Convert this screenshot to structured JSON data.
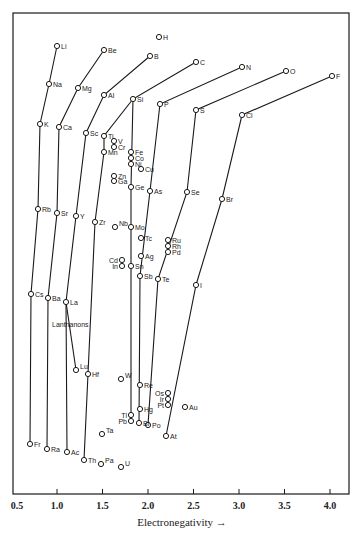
{
  "chart_data": {
    "type": "scatter",
    "title": "",
    "xlabel": "Electronegativity →",
    "ylabel": "",
    "xlim": [
      0.5,
      4.1
    ],
    "x_ticks": [
      "0.5",
      "1.0",
      "1.5",
      "2.0",
      "2.5",
      "3.0",
      "3.5",
      "4.0"
    ],
    "grid": false,
    "legend": null,
    "annotations": [
      "Lanthanons"
    ],
    "colors": {
      "ink": "#1a1a1a",
      "background": "#ffffff"
    },
    "points": [
      {
        "el": "H",
        "x": 2.1,
        "px": 159,
        "py": 37
      },
      {
        "el": "Li",
        "x": 1.0,
        "px": 57,
        "py": 46
      },
      {
        "el": "Na",
        "x": 0.9,
        "px": 49,
        "py": 84
      },
      {
        "el": "K",
        "x": 0.8,
        "px": 40,
        "py": 124
      },
      {
        "el": "Rb",
        "x": 0.8,
        "px": 38,
        "py": 209
      },
      {
        "el": "Cs",
        "x": 0.7,
        "px": 31,
        "py": 294
      },
      {
        "el": "Fr",
        "x": 0.7,
        "px": 30,
        "py": 444
      },
      {
        "el": "Be",
        "x": 1.5,
        "px": 104,
        "py": 50
      },
      {
        "el": "Mg",
        "x": 1.2,
        "px": 78,
        "py": 88
      },
      {
        "el": "Ca",
        "x": 1.0,
        "px": 59,
        "py": 127
      },
      {
        "el": "Sr",
        "x": 1.0,
        "px": 57,
        "py": 213
      },
      {
        "el": "Ba",
        "x": 0.9,
        "px": 48,
        "py": 298
      },
      {
        "el": "Ra",
        "x": 0.9,
        "px": 47,
        "py": 449
      },
      {
        "el": "B",
        "x": 2.0,
        "px": 150,
        "py": 56
      },
      {
        "el": "Al",
        "x": 1.5,
        "px": 104,
        "py": 95
      },
      {
        "el": "Sc",
        "x": 1.3,
        "px": 86,
        "py": 133
      },
      {
        "el": "Y",
        "x": 1.2,
        "px": 76,
        "py": 216
      },
      {
        "el": "La",
        "x": 1.1,
        "px": 66,
        "py": 302
      },
      {
        "el": "Lu",
        "x": 1.2,
        "px": 76,
        "py": 370
      },
      {
        "el": "Ac",
        "x": 1.1,
        "px": 67,
        "py": 452
      },
      {
        "el": "C",
        "x": 2.5,
        "px": 196,
        "py": 62
      },
      {
        "el": "Si",
        "x": 1.8,
        "px": 133,
        "py": 99
      },
      {
        "el": "Ti",
        "x": 1.5,
        "px": 104,
        "py": 136
      },
      {
        "el": "Mn",
        "x": 1.5,
        "px": 104,
        "py": 152
      },
      {
        "el": "Zr",
        "x": 1.4,
        "px": 95,
        "py": 222
      },
      {
        "el": "Hf",
        "x": 1.3,
        "px": 88,
        "py": 374
      },
      {
        "el": "Th",
        "x": 1.3,
        "px": 84,
        "py": 460
      },
      {
        "el": "N",
        "x": 3.0,
        "px": 242,
        "py": 67
      },
      {
        "el": "P",
        "x": 2.1,
        "px": 160,
        "py": 104
      },
      {
        "el": "As",
        "x": 2.0,
        "px": 150,
        "py": 191
      },
      {
        "el": "Sb",
        "x": 1.9,
        "px": 140,
        "py": 276
      },
      {
        "el": "Bi",
        "x": 1.9,
        "px": 139,
        "py": 423
      },
      {
        "el": "O",
        "x": 3.5,
        "px": 286,
        "py": 71
      },
      {
        "el": "S",
        "x": 2.5,
        "px": 196,
        "py": 110
      },
      {
        "el": "Se",
        "x": 2.4,
        "px": 187,
        "py": 192
      },
      {
        "el": "Te",
        "x": 2.1,
        "px": 158,
        "py": 279
      },
      {
        "el": "Po",
        "x": 2.0,
        "px": 148,
        "py": 425
      },
      {
        "el": "F",
        "x": 4.0,
        "px": 332,
        "py": 76
      },
      {
        "el": "Cl",
        "x": 3.0,
        "px": 242,
        "py": 115
      },
      {
        "el": "Br",
        "x": 2.8,
        "px": 222,
        "py": 199
      },
      {
        "el": "I",
        "x": 2.5,
        "px": 196,
        "py": 285
      },
      {
        "el": "At",
        "x": 2.2,
        "px": 166,
        "py": 436
      },
      {
        "el": "V",
        "x": 1.6,
        "px": 114,
        "py": 141
      },
      {
        "el": "Cr",
        "x": 1.6,
        "px": 114,
        "py": 147
      },
      {
        "el": "Fe",
        "x": 1.8,
        "px": 131,
        "py": 152
      },
      {
        "el": "Co",
        "x": 1.8,
        "px": 131,
        "py": 158
      },
      {
        "el": "Ni",
        "x": 1.8,
        "px": 131,
        "py": 164
      },
      {
        "el": "Cu",
        "x": 1.9,
        "px": 141,
        "py": 169
      },
      {
        "el": "Zn",
        "x": 1.6,
        "px": 114,
        "py": 176
      },
      {
        "el": "Ga",
        "x": 1.6,
        "px": 114,
        "py": 181
      },
      {
        "el": "Ge",
        "x": 1.8,
        "px": 131,
        "py": 187
      },
      {
        "el": "Nb",
        "x": 1.6,
        "px": 115,
        "py": 227
      },
      {
        "el": "Mo",
        "x": 1.8,
        "px": 131,
        "py": 227
      },
      {
        "el": "Tc",
        "x": 1.9,
        "px": 141,
        "py": 238
      },
      {
        "el": "Ru",
        "x": 2.2,
        "px": 168,
        "py": 240
      },
      {
        "el": "Rh",
        "x": 2.2,
        "px": 168,
        "py": 246
      },
      {
        "el": "Pd",
        "x": 2.2,
        "px": 168,
        "py": 252
      },
      {
        "el": "Ag",
        "x": 1.9,
        "px": 141,
        "py": 256
      },
      {
        "el": "Cd",
        "x": 1.7,
        "px": 122,
        "py": 260
      },
      {
        "el": "In",
        "x": 1.7,
        "px": 122,
        "py": 266
      },
      {
        "el": "Sn",
        "x": 1.8,
        "px": 131,
        "py": 266
      },
      {
        "el": "Ta",
        "x": 1.5,
        "px": 102,
        "py": 434
      },
      {
        "el": "W",
        "x": 1.7,
        "px": 121,
        "py": 379
      },
      {
        "el": "Re",
        "x": 1.9,
        "px": 140,
        "py": 385
      },
      {
        "el": "Os",
        "x": 2.2,
        "px": 168,
        "py": 393
      },
      {
        "el": "Ir",
        "x": 2.2,
        "px": 168,
        "py": 399
      },
      {
        "el": "Pt",
        "x": 2.2,
        "px": 168,
        "py": 405
      },
      {
        "el": "Au",
        "x": 2.4,
        "px": 185,
        "py": 407
      },
      {
        "el": "Hg",
        "x": 1.9,
        "px": 140,
        "py": 409
      },
      {
        "el": "Tl",
        "x": 1.8,
        "px": 131,
        "py": 415
      },
      {
        "el": "Pb",
        "x": 1.8,
        "px": 131,
        "py": 421
      },
      {
        "el": "Pa",
        "x": 1.5,
        "px": 101,
        "py": 464
      },
      {
        "el": "U",
        "x": 1.7,
        "px": 121,
        "py": 467
      }
    ],
    "series": [
      {
        "name": "Group 1",
        "path": [
          "Li",
          "Na",
          "K",
          "Rb",
          "Cs",
          "Fr"
        ]
      },
      {
        "name": "Group 2",
        "path": [
          "Be",
          "Mg",
          "Ca",
          "Sr",
          "Ba",
          "Ra"
        ]
      },
      {
        "name": "Group 3",
        "path": [
          "B",
          "Al",
          "Sc",
          "Y",
          "La",
          "Ac"
        ]
      },
      {
        "name": "Lanthanons",
        "path": [
          "La",
          "Lu"
        ]
      },
      {
        "name": "Group 4A",
        "path": [
          "Si",
          "Ti",
          "Mn"
        ]
      },
      {
        "name": "Group 4A-b",
        "path": [
          "Mn",
          "Zr",
          "Hf",
          "Th"
        ]
      },
      {
        "name": "Group 4",
        "path": [
          "C",
          "Si",
          "Ge",
          "Sn",
          "Pb"
        ]
      },
      {
        "name": "Group 5",
        "path": [
          "N",
          "P",
          "As",
          "Sb",
          "Bi"
        ]
      },
      {
        "name": "Group 6",
        "path": [
          "O",
          "S",
          "Se",
          "Te",
          "Po"
        ]
      },
      {
        "name": "Group 7",
        "path": [
          "F",
          "Cl",
          "Br",
          "I",
          "At"
        ]
      }
    ],
    "label_offsets": {
      "default": [
        4,
        3
      ],
      "left": [
        "Cd",
        "In",
        "Tl",
        "Pb",
        "Os",
        "Ir",
        "Pt"
      ],
      "above": [
        "Nb",
        "Ta",
        "W",
        "Pa",
        "U",
        "Lu"
      ]
    }
  }
}
